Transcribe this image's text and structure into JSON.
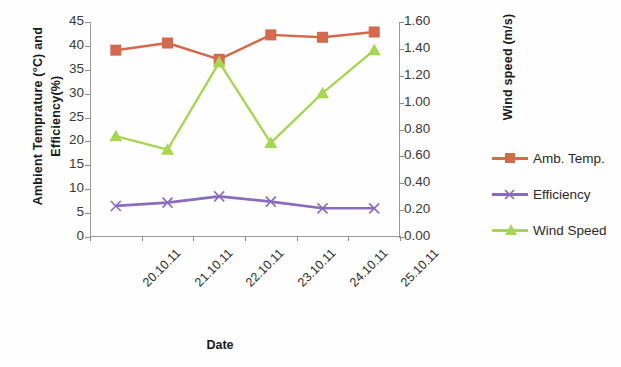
{
  "chart_data": {
    "type": "line",
    "title": "",
    "xlabel": "Date",
    "ylabel": "Ambient Temprature (°C) and Efficiency(%)",
    "y2label": "Wind speed (m/s)",
    "categories": [
      "20.10.11",
      "21.10.11",
      "22.10.11",
      "23.10.11",
      "24.10.11",
      "25.10.11"
    ],
    "ylim": [
      0,
      45
    ],
    "y2lim": [
      0.0,
      1.6
    ],
    "yticks": [
      "45",
      "40",
      "35",
      "30",
      "25",
      "20",
      "15",
      "10",
      "5",
      "0"
    ],
    "y2ticks": [
      "1.60",
      "1.40",
      "1.20",
      "1.00",
      "0.80",
      "0.60",
      "0.40",
      "0.20",
      "0.00"
    ],
    "grid": false,
    "legend_position": "right",
    "series": [
      {
        "name": "Amb. Temp.",
        "axis": "left",
        "color": "#D4694B",
        "marker": "square",
        "values": [
          39.1,
          40.6,
          37.2,
          42.3,
          41.8,
          42.9
        ]
      },
      {
        "name": "Efficiency",
        "axis": "left",
        "color": "#8A6BBF",
        "marker": "x",
        "values": [
          6.5,
          7.2,
          8.5,
          7.4,
          6.0,
          6.0
        ]
      },
      {
        "name": "Wind Speed",
        "axis": "right",
        "color": "#A7D74F",
        "marker": "triangle",
        "values": [
          0.75,
          0.65,
          1.3,
          0.7,
          1.07,
          1.39
        ]
      }
    ]
  },
  "legend": {
    "items": [
      {
        "label": "Amb. Temp."
      },
      {
        "label": "Efficiency"
      },
      {
        "label": "Wind Speed"
      }
    ]
  }
}
